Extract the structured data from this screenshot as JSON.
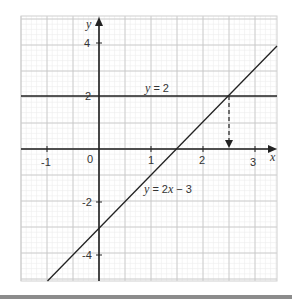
{
  "chart_data": {
    "type": "line",
    "title": "",
    "xlabel": "x",
    "ylabel": "y",
    "xlim": [
      -1.5,
      3.42
    ],
    "ylim": [
      -5,
      5
    ],
    "grid": true,
    "x_ticks": [
      -1,
      0,
      1,
      2,
      3
    ],
    "x_tick_labels": [
      "-1",
      "0",
      "1",
      "2",
      "3"
    ],
    "y_ticks": [
      -4,
      -2,
      2,
      4
    ],
    "y_tick_labels": [
      "-4",
      "-2",
      "2",
      "4"
    ],
    "series": [
      {
        "name": "y = 2x − 3",
        "kind": "line",
        "slope": 2,
        "intercept": -3,
        "x": [
          -1,
          3.42
        ],
        "y": [
          -5,
          3.84
        ]
      },
      {
        "name": "y = 2",
        "kind": "horizontal",
        "y_value": 2
      }
    ],
    "annotations": [
      {
        "text": "y = 2",
        "x": 1,
        "y": 2.2
      },
      {
        "text": "y = 2x − 3",
        "x": 1.05,
        "y": -1.6
      },
      {
        "type": "dashed-arrow",
        "from": [
          2.5,
          2
        ],
        "to": [
          2.5,
          0
        ],
        "note": "intersection x = 2.5"
      }
    ]
  },
  "labels": {
    "x_axis": "x",
    "y_axis": "y",
    "line1_label_y": "y",
    "line1_label_rest": " = 2",
    "line2_label_y": "y",
    "line2_label_rest": " = 2",
    "line2_label_x": "x",
    "line2_label_tail": " − 3",
    "x_ticks": [
      "-1",
      "0",
      "1",
      "2",
      "3"
    ],
    "y_ticks": [
      "4",
      "2",
      "-2",
      "-4"
    ]
  },
  "colors": {
    "axis": "#222222",
    "grid_major": "#c8c8c8",
    "grid_minor": "#ececec",
    "line": "#222222"
  }
}
